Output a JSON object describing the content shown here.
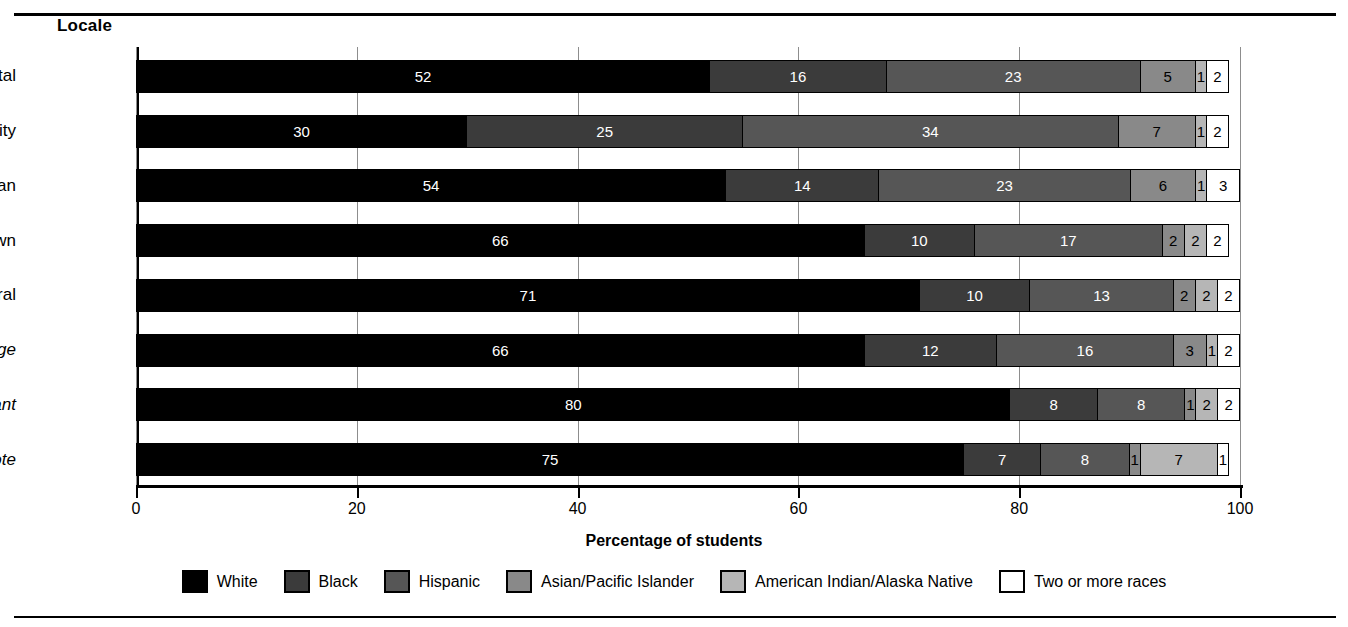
{
  "figure": {
    "locale_axis_title": "Locale",
    "xaxis_title": "Percentage of students"
  },
  "chart_data": {
    "type": "bar",
    "orientation": "horizontal",
    "stacked": true,
    "title": "",
    "xlabel": "Percentage of students",
    "ylabel": "Locale",
    "xlim": [
      0,
      100
    ],
    "xticks": [
      "0",
      "20",
      "40",
      "60",
      "80",
      "100"
    ],
    "grid": true,
    "legend_position": "bottom",
    "categories": [
      "Total",
      "City",
      "Suburban",
      "Town",
      "Rural",
      "Rural, fringe",
      "Rural, distant",
      "Rural, remote"
    ],
    "category_parts": [
      {
        "main": "Total",
        "italic": ""
      },
      {
        "main": "City",
        "italic": ""
      },
      {
        "main": "Suburban",
        "italic": ""
      },
      {
        "main": "Town",
        "italic": ""
      },
      {
        "main": "Rural",
        "italic": ""
      },
      {
        "main": "Rural, ",
        "italic": "fringe"
      },
      {
        "main": "Rural, ",
        "italic": "distant"
      },
      {
        "main": "Rural, ",
        "italic": "remote"
      }
    ],
    "series": [
      {
        "name": "White",
        "color": "#000000",
        "values": [
          52,
          30,
          54,
          66,
          71,
          66,
          80,
          75
        ]
      },
      {
        "name": "Black",
        "color": "#3b3b3b",
        "values": [
          16,
          25,
          14,
          10,
          10,
          12,
          8,
          7
        ]
      },
      {
        "name": "Hispanic",
        "color": "#565656",
        "values": [
          23,
          34,
          23,
          17,
          13,
          16,
          8,
          8
        ]
      },
      {
        "name": "Asian/Pacific Islander",
        "color": "#898989",
        "values": [
          5,
          7,
          6,
          2,
          2,
          3,
          1,
          1
        ]
      },
      {
        "name": "American Indian/Alaska Native",
        "color": "#b6b6b6",
        "values": [
          1,
          1,
          1,
          2,
          2,
          1,
          2,
          7
        ]
      },
      {
        "name": "Two or more races",
        "color": "#ffffff",
        "values": [
          2,
          2,
          3,
          2,
          2,
          2,
          2,
          1
        ]
      }
    ]
  }
}
